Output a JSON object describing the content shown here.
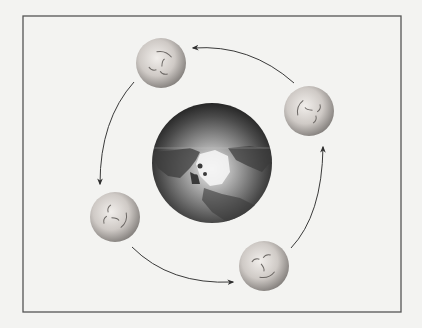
{
  "diagram": {
    "title": "",
    "canvas": {
      "width": 422,
      "height": 328,
      "background": "#f3f3f1"
    },
    "frame": {
      "x": 23,
      "y": 16,
      "width": 378,
      "height": 296,
      "stroke": "#555555"
    },
    "earth": {
      "cx": 212,
      "cy": 163,
      "r": 60,
      "view": "north-pole"
    },
    "moons": [
      {
        "id": "moon-top",
        "cx": 161,
        "cy": 63,
        "r": 25,
        "face_rotation": 200
      },
      {
        "id": "moon-right",
        "cx": 309,
        "cy": 111,
        "r": 25,
        "face_rotation": 110
      },
      {
        "id": "moon-bottom",
        "cx": 264,
        "cy": 266,
        "r": 25,
        "face_rotation": -20
      },
      {
        "id": "moon-left",
        "cx": 115,
        "cy": 217,
        "r": 25,
        "face_rotation": 290
      }
    ],
    "arrows": [
      {
        "id": "arrow-right-to-top",
        "from": "moon-right",
        "to": "moon-top",
        "path": "M294,83 Q250,44 193,48"
      },
      {
        "id": "arrow-top-to-left",
        "from": "moon-top",
        "to": "moon-left",
        "path": "M134,82 Q100,120 100,184"
      },
      {
        "id": "arrow-left-to-bottom",
        "from": "moon-left",
        "to": "moon-bottom",
        "path": "M132,247 Q170,285 233,282"
      },
      {
        "id": "arrow-bottom-to-right",
        "from": "moon-bottom",
        "to": "moon-right",
        "path": "M291,248 Q322,215 323,147"
      }
    ],
    "colors": {
      "arrow": "#3a3a3a",
      "moon_light": "#e6e2de",
      "moon_dark": "#8a8682",
      "earth_light": "#f2f2f2",
      "earth_dark": "#2e2e2e"
    }
  }
}
